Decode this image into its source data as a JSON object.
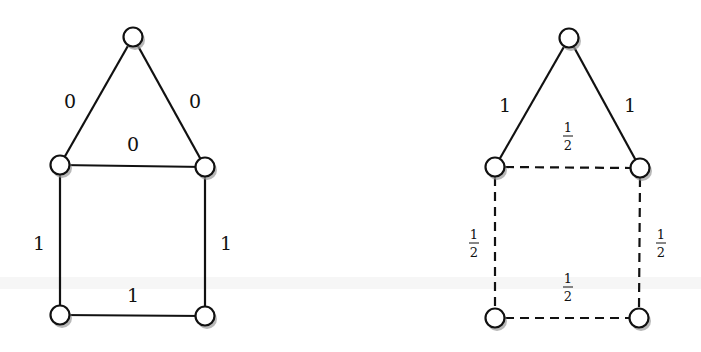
{
  "diagrams": [
    {
      "id": "left",
      "description": "House graph with integer edge weights",
      "nodes": [
        {
          "id": "top",
          "x": 133,
          "y": 37
        },
        {
          "id": "mid-left",
          "x": 60,
          "y": 165
        },
        {
          "id": "mid-right",
          "x": 205,
          "y": 167
        },
        {
          "id": "bottom-left",
          "x": 60,
          "y": 315
        },
        {
          "id": "bottom-right",
          "x": 205,
          "y": 316
        }
      ],
      "edges": [
        {
          "from": "top",
          "to": "mid-left",
          "label": "0",
          "style": "solid",
          "lx": 70,
          "ly": 108
        },
        {
          "from": "top",
          "to": "mid-right",
          "label": "0",
          "style": "solid",
          "lx": 195,
          "ly": 108
        },
        {
          "from": "mid-left",
          "to": "mid-right",
          "label": "0",
          "style": "solid",
          "lx": 133,
          "ly": 151
        },
        {
          "from": "mid-left",
          "to": "bottom-left",
          "label": "1",
          "style": "solid",
          "lx": 39,
          "ly": 250
        },
        {
          "from": "mid-right",
          "to": "bottom-right",
          "label": "1",
          "style": "solid",
          "lx": 226,
          "ly": 250
        },
        {
          "from": "bottom-left",
          "to": "bottom-right",
          "label": "1",
          "style": "solid",
          "lx": 133,
          "ly": 302
        }
      ]
    },
    {
      "id": "right",
      "description": "House graph with fractional edge weights",
      "nodes": [
        {
          "id": "top",
          "x": 569,
          "y": 38
        },
        {
          "id": "mid-left",
          "x": 495,
          "y": 167
        },
        {
          "id": "mid-right",
          "x": 640,
          "y": 168
        },
        {
          "id": "bottom-left",
          "x": 495,
          "y": 318
        },
        {
          "id": "bottom-right",
          "x": 639,
          "y": 318
        }
      ],
      "edges": [
        {
          "from": "top",
          "to": "mid-left",
          "label": "1",
          "style": "solid",
          "lx": 505,
          "ly": 112
        },
        {
          "from": "top",
          "to": "mid-right",
          "label": "1",
          "style": "solid",
          "lx": 630,
          "ly": 112
        },
        {
          "from": "mid-left",
          "to": "mid-right",
          "label": "1/2",
          "style": "dashed",
          "lx": 568,
          "ly": 136
        },
        {
          "from": "mid-left",
          "to": "bottom-left",
          "label": "1/2",
          "style": "dashed",
          "lx": 474,
          "ly": 243
        },
        {
          "from": "mid-right",
          "to": "bottom-right",
          "label": "1/2",
          "style": "dashed",
          "lx": 661,
          "ly": 243
        },
        {
          "from": "bottom-left",
          "to": "bottom-right",
          "label": "1/2",
          "style": "dashed",
          "lx": 568,
          "ly": 287
        }
      ]
    }
  ],
  "labels": {
    "left": {
      "e_top_left": "0",
      "e_top_right": "0",
      "e_mid": "0",
      "e_left": "1",
      "e_right": "1",
      "e_bottom": "1"
    },
    "right": {
      "e_top_left": "1",
      "e_top_right": "1",
      "frac_num": "1",
      "frac_den": "2"
    }
  }
}
